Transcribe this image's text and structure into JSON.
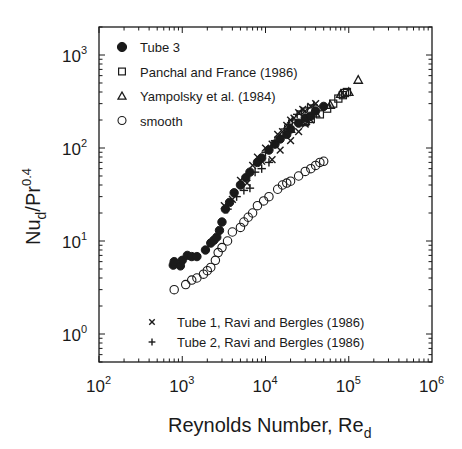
{
  "chart_data": {
    "type": "scatter",
    "title": "",
    "xlabel": "Reynolds Number, Re_d",
    "xlabel_main": "Reynolds Number, Re",
    "xlabel_sub": "d",
    "ylabel": "Nu_d/Pr^0.4",
    "ylabel_parts": {
      "base": "Nu",
      "sub": "d",
      "mid": "/Pr",
      "sup": "0.4"
    },
    "xscale": "log",
    "yscale": "log",
    "xlim": [
      100,
      1000000
    ],
    "ylim": [
      0.5,
      2000
    ],
    "grid": false,
    "x_ticks": [
      {
        "value": 100,
        "base": "10",
        "exp": "2"
      },
      {
        "value": 1000,
        "base": "10",
        "exp": "3"
      },
      {
        "value": 10000,
        "base": "10",
        "exp": "4"
      },
      {
        "value": 100000,
        "base": "10",
        "exp": "5"
      },
      {
        "value": 1000000,
        "base": "10",
        "exp": "6"
      }
    ],
    "y_ticks": [
      {
        "value": 1,
        "base": "10",
        "exp": "0"
      },
      {
        "value": 10,
        "base": "10",
        "exp": "1"
      },
      {
        "value": 100,
        "base": "10",
        "exp": "2"
      },
      {
        "value": 1000,
        "base": "10",
        "exp": "3"
      }
    ],
    "legend_upper": [
      {
        "marker": "filled-circle",
        "label": "Tube 3"
      },
      {
        "marker": "square",
        "label": "Panchal and France (1986)"
      },
      {
        "marker": "triangle",
        "label": "Yampolsky et al. (1984)"
      },
      {
        "marker": "open-circle",
        "label": "smooth"
      }
    ],
    "legend_lower": [
      {
        "marker": "x",
        "label": "Tube 1, Ravi and Bergles (1986)"
      },
      {
        "marker": "plus",
        "label": "Tube 2, Ravi and Bergles (1986)"
      }
    ],
    "series": [
      {
        "name": "Tube 3",
        "marker": "filled-circle",
        "points": [
          [
            780,
            5.5
          ],
          [
            800,
            6.0
          ],
          [
            950,
            5.4
          ],
          [
            1000,
            6.2
          ],
          [
            1150,
            7.0
          ],
          [
            1300,
            6.8
          ],
          [
            1500,
            6.8
          ],
          [
            1900,
            8.0
          ],
          [
            2200,
            9.5
          ],
          [
            2400,
            10.2
          ],
          [
            2600,
            11
          ],
          [
            2800,
            13
          ],
          [
            3000,
            16
          ],
          [
            3300,
            22
          ],
          [
            3700,
            26
          ],
          [
            4200,
            33
          ],
          [
            5000,
            40
          ],
          [
            5800,
            48
          ],
          [
            6500,
            55
          ],
          [
            8000,
            70
          ],
          [
            9000,
            78
          ],
          [
            11000,
            95
          ],
          [
            13000,
            110
          ],
          [
            15000,
            125
          ],
          [
            18000,
            140
          ],
          [
            20000,
            160
          ],
          [
            25000,
            185
          ],
          [
            30000,
            210
          ],
          [
            35000,
            220
          ],
          [
            40000,
            250
          ],
          [
            50000,
            280
          ]
        ]
      },
      {
        "name": "Panchal and France (1986)",
        "marker": "square",
        "points": [
          [
            30000,
            190
          ],
          [
            35000,
            205
          ],
          [
            45000,
            230
          ],
          [
            55000,
            265
          ],
          [
            65000,
            300
          ],
          [
            75000,
            340
          ],
          [
            85000,
            370
          ],
          [
            90000,
            390
          ],
          [
            95000,
            400
          ]
        ]
      },
      {
        "name": "Yampolsky et al. (1984)",
        "marker": "triangle",
        "points": [
          [
            20000,
            160
          ],
          [
            30000,
            195
          ],
          [
            40000,
            235
          ],
          [
            60000,
            290
          ],
          [
            80000,
            380
          ],
          [
            100000,
            400
          ],
          [
            130000,
            540
          ]
        ]
      },
      {
        "name": "smooth",
        "marker": "open-circle",
        "points": [
          [
            800,
            3.0
          ],
          [
            1100,
            3.4
          ],
          [
            1300,
            3.8
          ],
          [
            1500,
            4.0
          ],
          [
            1800,
            4.4
          ],
          [
            2000,
            4.8
          ],
          [
            2200,
            5.2
          ],
          [
            2500,
            6.2
          ],
          [
            2700,
            7.5
          ],
          [
            3000,
            8.5
          ],
          [
            3500,
            10
          ],
          [
            4000,
            12.5
          ],
          [
            5000,
            14
          ],
          [
            5500,
            16
          ],
          [
            6200,
            18
          ],
          [
            7000,
            20
          ],
          [
            8000,
            24
          ],
          [
            9500,
            27
          ],
          [
            11000,
            30
          ],
          [
            14000,
            36
          ],
          [
            16000,
            40
          ],
          [
            18000,
            42
          ],
          [
            20000,
            44
          ],
          [
            25000,
            50
          ],
          [
            30000,
            56
          ],
          [
            35000,
            60
          ],
          [
            40000,
            65
          ],
          [
            45000,
            70
          ],
          [
            50000,
            72
          ]
        ]
      },
      {
        "name": "Tube 1, Ravi and Bergles (1986)",
        "marker": "x",
        "points": [
          [
            3200,
            24
          ],
          [
            4000,
            28
          ],
          [
            5000,
            45
          ],
          [
            6000,
            42
          ],
          [
            7000,
            65
          ],
          [
            8000,
            80
          ],
          [
            9000,
            72
          ],
          [
            10000,
            100
          ],
          [
            12000,
            110
          ],
          [
            14000,
            140
          ],
          [
            16000,
            150
          ],
          [
            18000,
            175
          ],
          [
            20000,
            200
          ],
          [
            22000,
            210
          ],
          [
            25000,
            240
          ],
          [
            28000,
            260
          ],
          [
            30000,
            250
          ],
          [
            35000,
            280
          ],
          [
            40000,
            300
          ],
          [
            12000,
            75
          ],
          [
            15000,
            95
          ],
          [
            20000,
            120
          ],
          [
            25000,
            150
          ],
          [
            30000,
            180
          ],
          [
            35000,
            200
          ]
        ]
      },
      {
        "name": "Tube 2, Ravi and Bergles (1986)",
        "marker": "plus",
        "points": [
          [
            3500,
            22
          ],
          [
            4500,
            30
          ],
          [
            5500,
            35
          ],
          [
            6500,
            37
          ],
          [
            7500,
            55
          ],
          [
            9000,
            60
          ],
          [
            10000,
            90
          ],
          [
            11000,
            70
          ],
          [
            13000,
            120
          ],
          [
            15000,
            130
          ],
          [
            17000,
            160
          ],
          [
            19000,
            180
          ],
          [
            21000,
            200
          ],
          [
            24000,
            230
          ],
          [
            27000,
            250
          ],
          [
            32000,
            270
          ],
          [
            38000,
            290
          ]
        ]
      }
    ]
  }
}
